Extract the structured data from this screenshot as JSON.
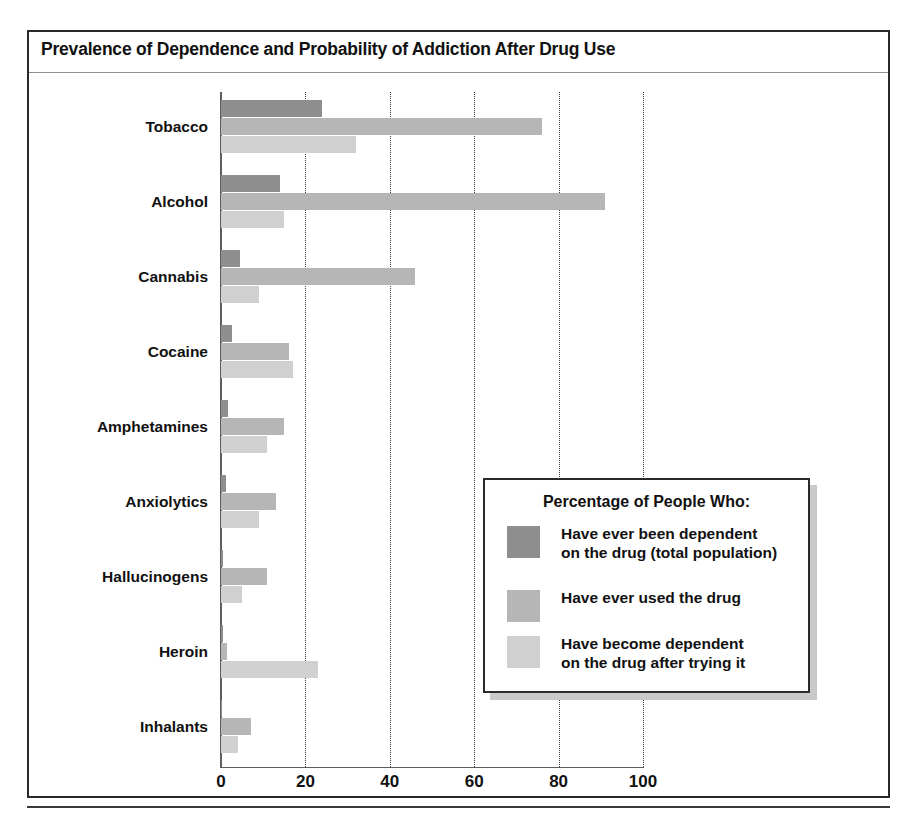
{
  "figure": {
    "title": "Prevalence of Dependence and Probability of Addiction After Drug Use",
    "caption": ""
  },
  "legend": {
    "title": "Percentage of People Who:",
    "entries": [
      {
        "label": "Have ever been dependent\non the drug (total population)",
        "color": "#8e8e8e"
      },
      {
        "label": "Have ever used the drug",
        "color": "#b6b6b6"
      },
      {
        "label": "Have become dependent\non the drug after trying it",
        "color": "#d0d0d0"
      }
    ]
  },
  "chart_data": {
    "type": "bar",
    "orientation": "horizontal",
    "title": "Prevalence of Dependence and Probability of Addiction After Drug Use",
    "xlabel": "",
    "ylabel": "",
    "xlim": [
      0,
      100
    ],
    "xticks": [
      0,
      20,
      40,
      60,
      80,
      100
    ],
    "xtick_labels": [
      "0",
      "20",
      "40",
      "60",
      "80",
      "100"
    ],
    "grid": "vertical-dotted",
    "legend_position": "inside-bottom-right",
    "categories": [
      "Tobacco",
      "Alcohol",
      "Cannabis",
      "Cocaine",
      "Amphetamines",
      "Anxiolytics",
      "Hallucinogens",
      "Heroin",
      "Inhalants"
    ],
    "series": [
      {
        "name": "Have ever been dependent on the drug (total population)",
        "color": "#8e8e8e",
        "values": [
          24,
          14,
          4.5,
          2.7,
          1.7,
          1.2,
          0.5,
          0.4,
          0.3
        ]
      },
      {
        "name": "Have ever used the drug",
        "color": "#b6b6b6",
        "values": [
          76,
          91,
          46,
          16,
          15,
          13,
          11,
          1.5,
          7
        ]
      },
      {
        "name": "Have become dependent on the drug after trying it",
        "color": "#d0d0d0",
        "values": [
          32,
          15,
          9,
          17,
          11,
          9,
          5,
          23,
          4
        ]
      }
    ]
  }
}
